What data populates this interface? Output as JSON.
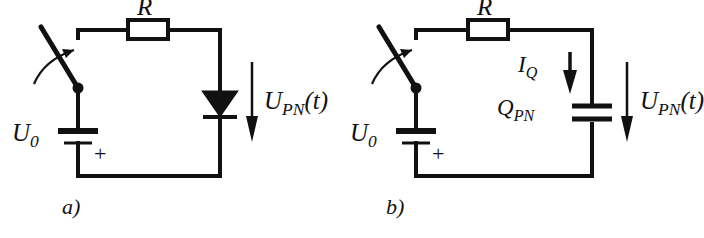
{
  "figure": {
    "type": "circuit-diagram",
    "background_color": "#ffffff",
    "line_color": "#111111",
    "width": 701,
    "height": 238
  },
  "panels": [
    {
      "id": "a",
      "caption": "a)",
      "components": [
        {
          "name": "switch",
          "type": "spst-switch",
          "state": "open",
          "annotation": "curved closing arrow"
        },
        {
          "name": "resistor",
          "type": "resistor",
          "label": "R",
          "position": "top branch"
        },
        {
          "name": "diode",
          "type": "diode",
          "orientation": "cathode-down",
          "position": "right branch"
        },
        {
          "name": "source",
          "type": "dc-voltage-source",
          "label": "U",
          "label_sub": "0",
          "polarity_marker": "+",
          "position": "left branch"
        }
      ],
      "annotations": [
        {
          "name": "voltage-arrow",
          "label": "U",
          "label_sub": "PN",
          "label_arg": "(t)",
          "direction": "down"
        }
      ]
    },
    {
      "id": "b",
      "caption": "b)",
      "components": [
        {
          "name": "switch",
          "type": "spst-switch",
          "state": "open",
          "annotation": "curved closing arrow"
        },
        {
          "name": "resistor",
          "type": "resistor",
          "label": "R",
          "position": "top branch"
        },
        {
          "name": "capacitor",
          "type": "capacitor",
          "label": "Q",
          "label_sub": "PN",
          "position": "right branch"
        },
        {
          "name": "source",
          "type": "dc-voltage-source",
          "label": "U",
          "label_sub": "0",
          "polarity_marker": "+",
          "position": "left branch"
        }
      ],
      "annotations": [
        {
          "name": "current-arrow",
          "label": "I",
          "label_sub": "Q",
          "direction": "down"
        },
        {
          "name": "voltage-arrow",
          "label": "U",
          "label_sub": "PN",
          "label_arg": "(t)",
          "direction": "down"
        }
      ]
    }
  ],
  "text": {
    "resistor_a": "R",
    "resistor_b": "R",
    "source_a_main": "U",
    "source_a_sub": "0",
    "source_b_main": "U",
    "source_b_sub": "0",
    "plus_a": "+",
    "plus_b": "+",
    "upn_a_main": "U",
    "upn_a_sub": "PN",
    "upn_a_arg": "(t)",
    "upn_b_main": "U",
    "upn_b_sub": "PN",
    "upn_b_arg": "(t)",
    "iq_main": "I",
    "iq_sub": "Q",
    "qpn_main": "Q",
    "qpn_sub": "PN",
    "caption_a": "a)",
    "caption_b": "b)"
  },
  "colors": {
    "stroke": "#111111",
    "fill": "#ffffff",
    "text": "#111111"
  }
}
